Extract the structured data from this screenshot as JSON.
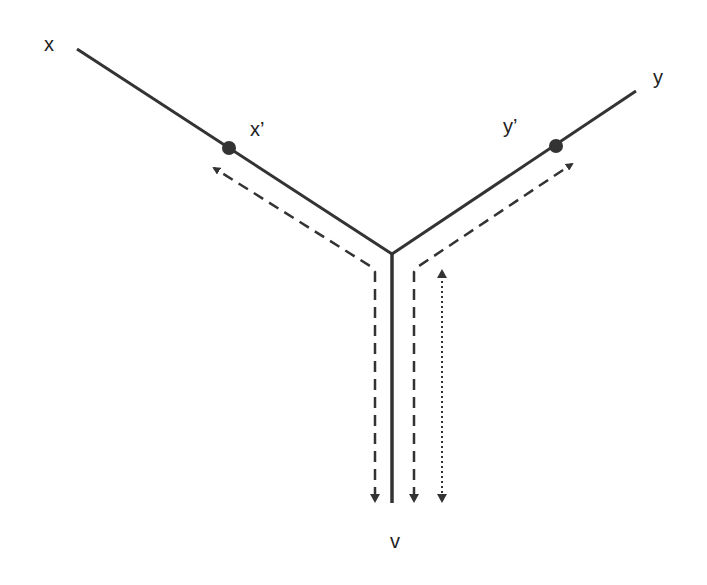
{
  "diagram": {
    "type": "tree-path",
    "nodes": [
      {
        "id": "x",
        "label": "x",
        "role": "endpoint"
      },
      {
        "id": "x_prime",
        "label": "x’",
        "role": "marked-point"
      },
      {
        "id": "y",
        "label": "y",
        "role": "endpoint"
      },
      {
        "id": "y_prime",
        "label": "y’",
        "role": "marked-point"
      },
      {
        "id": "v",
        "label": "v",
        "role": "endpoint"
      }
    ],
    "edges": [
      {
        "from": "x",
        "to": "junction",
        "style": "solid"
      },
      {
        "from": "y",
        "to": "junction",
        "style": "solid"
      },
      {
        "from": "junction",
        "to": "v",
        "style": "solid"
      }
    ],
    "arrows": [
      {
        "from": "v",
        "to": "x_prime",
        "style": "dashed",
        "side": "left"
      },
      {
        "from": "y_prime",
        "to": "v",
        "style": "dashed",
        "side": "right",
        "direction": "down"
      },
      {
        "from": "v",
        "to": "y_prime",
        "style": "dashed",
        "direction": "up-right"
      },
      {
        "from": "v",
        "to": "junction",
        "style": "dotted",
        "bidirectional": true
      }
    ]
  },
  "labels": {
    "x": "x",
    "x_prime": "x’",
    "y": "y",
    "y_prime": "y’",
    "v": "v"
  },
  "colors": {
    "line": "#333333",
    "dot": "#333333",
    "text": "#222222",
    "background": "#ffffff"
  }
}
